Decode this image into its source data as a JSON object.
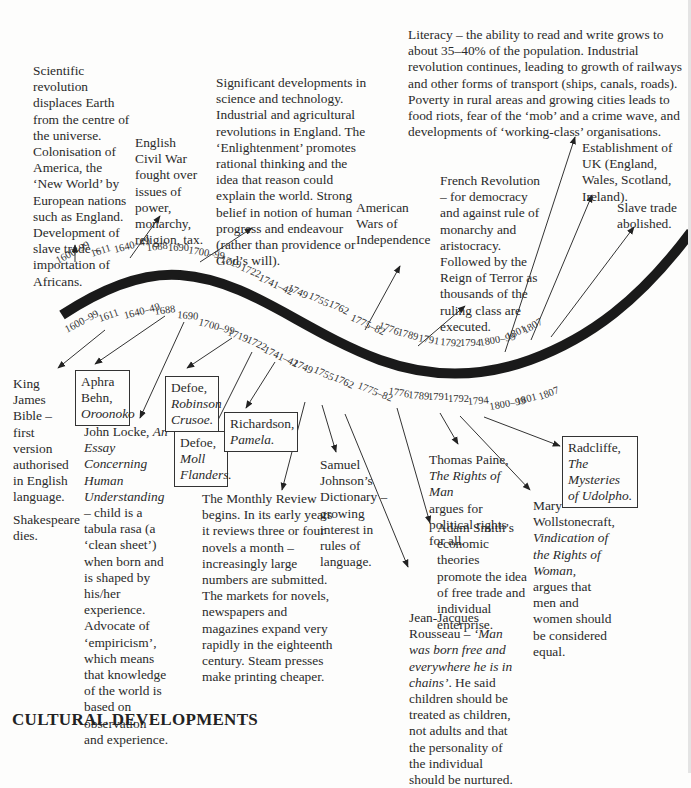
{
  "title": "CULTURAL DEVELOPMENTS",
  "timeline_years_upper": [
    "1600–99",
    "1611",
    "1640–49",
    "1688",
    "1690",
    "1700–99",
    "1719",
    "1722",
    "1741–42",
    "1749",
    "1755",
    "1762",
    "1775–82",
    "1776",
    "1789",
    "1791",
    "1792",
    "1794",
    "1800–99",
    "1801",
    "1807"
  ],
  "timeline_years_lower": [
    "1600–99",
    "1611",
    "1640–49",
    "1688",
    "1690",
    "1700–99",
    "1719",
    "1722",
    "1741–42",
    "1749",
    "1755",
    "1762",
    "1775–82",
    "1776",
    "1789",
    "1791",
    "1792",
    "1794",
    "1800–99",
    "1801",
    "1807"
  ],
  "historical": {
    "scientific": "Scientific revolution displaces Earth from the centre of the universe. Colonisation of America, the ‘New World’ by European nations such as England. Development of slave trade – importation of Africans.",
    "civil_war": "English Civil War fought over issues of power, monarchy, religion, tax.",
    "enlightenment": "Significant developments in science and technology. Industrial and agricultural revolutions in England. The ‘Enlightenment’ promotes rational thinking and the idea that reason could explain the world. Strong belief in notion of human progress and endeavour (rather than providence or God’s will).",
    "american": "American Wars of Independence",
    "literacy": "Literacy – the ability to read and write grows to about 35–40% of the population. Industrial revolution continues, leading to growth of railways and other forms of transport (ships, canals, roads). Poverty in rural areas and growing cities leads to food riots, fear of the ‘mob’ and a crime wave, and developments of ‘working-class’ organisations.",
    "french": "French Revolution – for democracy and against rule of monarchy and aristocracy. Followed by the Reign of Terror as thousands of the ruling class are executed.",
    "uk": "Establishment of UK (England, Wales, Scotland, Ireland).",
    "slave": "Slave trade abolished."
  },
  "cultural": {
    "kjb": "King James Bible – first version authorised in English language.",
    "shakespeare": "Shakespeare dies.",
    "behn_author": "Aphra Behn,",
    "behn_title": "Oroonoko",
    "locke_a": "John Locke,",
    "locke_title": "An Essay Concerning Human Understanding",
    "locke_b": "– child is a tabula rasa (a ‘clean sheet’) when born and is shaped by his/her experience. Advocate of ‘empiricism’, which means that knowledge of the world is based on observation and experience.",
    "crusoe_author": "Defoe,",
    "crusoe_title": "Robinson Crusoe.",
    "moll_author": "Defoe,",
    "moll_title": "Moll Flanders.",
    "pamela_author": "Richardson,",
    "pamela_title": "Pamela.",
    "monthly": "The Monthly Review begins. In its early years it reviews three or four novels a month – increasingly large numbers are submitted. The markets for novels, newspapers and magazines expand very rapidly in the eighteenth century. Steam presses make printing cheaper.",
    "johnson": "Samuel Johnson’s Dictionary – growing interest in rules of language.",
    "rousseau_a": "Jean-Jacques Rousseau –",
    "rousseau_quote": "‘Man was born free and everywhere he is in chains’",
    "rousseau_b": ". He said children should be treated as children, not adults and that the personality of the individual should be nurtured.",
    "smith": "Adam Smith’s economic theories promote the idea of free trade and individual enterprise.",
    "paine_a": "Thomas Paine,",
    "paine_title": "The Rights of Man",
    "paine_b": "argues for political rights for all.",
    "wollstonecraft_a": "Mary Wollstonecraft,",
    "wollstonecraft_title": "Vindication of the Rights of Woman,",
    "wollstonecraft_b": "argues that men and women should be considered equal.",
    "radcliffe_author": "Radcliffe,",
    "radcliffe_title": "The Mysteries of Udolpho."
  }
}
